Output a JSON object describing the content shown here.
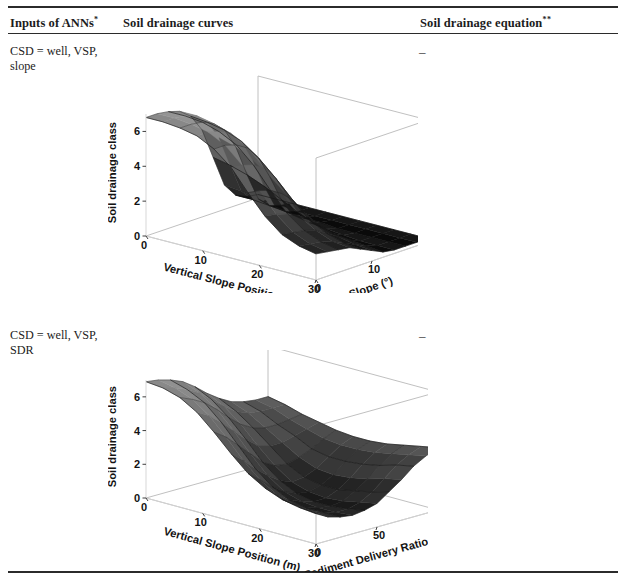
{
  "table": {
    "headers": [
      {
        "text": "Inputs of ANNs",
        "sup": "*"
      },
      {
        "text": "Soil drainage curves",
        "sup": ""
      },
      {
        "text": "Soil drainage equation",
        "sup": "**"
      }
    ],
    "rows": [
      {
        "inputs": "CSD = well, VSP, slope",
        "equation": "–"
      },
      {
        "inputs": "CSD = well, VSP, SDR",
        "equation": "–"
      }
    ]
  },
  "chart_data": [
    {
      "type": "surface",
      "title": "",
      "xlabel": "Vertical Slope Position (m)",
      "ylabel": "Slope (°)",
      "zlabel": "Soil drainage class",
      "xticks": [
        0,
        10,
        20,
        30
      ],
      "yticks": [
        0,
        10,
        20
      ],
      "zticks": [
        0,
        2,
        4,
        6
      ],
      "xlim": [
        0,
        30
      ],
      "ylim": [
        0,
        20
      ],
      "zlim": [
        0,
        7
      ],
      "grid": true,
      "legend": "none",
      "colormap": "gray",
      "description": "Soil drainage class surface; high (~6-7) plateau at low slope / low VSP falling steeply to near 0-1 at high slope, with oscillating ridges near the drop-off edge.",
      "surface_z": [
        [
          6.8,
          6.8,
          6.7,
          6.5,
          6.0,
          5.0,
          3.2,
          1.4,
          0.6,
          0.3,
          0.2
        ],
        [
          6.8,
          6.8,
          6.7,
          6.5,
          5.9,
          4.8,
          3.0,
          1.3,
          0.6,
          0.3,
          0.2
        ],
        [
          6.7,
          6.7,
          6.6,
          6.3,
          5.7,
          4.5,
          2.7,
          1.1,
          0.5,
          0.3,
          0.2
        ],
        [
          6.5,
          6.5,
          6.3,
          6.0,
          5.3,
          4.0,
          2.3,
          0.9,
          0.4,
          0.2,
          0.2
        ],
        [
          6.0,
          6.0,
          5.8,
          5.4,
          4.6,
          3.3,
          1.8,
          0.7,
          0.3,
          0.2,
          0.2
        ],
        [
          5.2,
          5.1,
          4.9,
          4.5,
          3.7,
          2.5,
          1.3,
          0.5,
          0.3,
          0.2,
          0.2
        ],
        [
          4.0,
          3.9,
          3.7,
          3.3,
          2.7,
          1.8,
          0.9,
          0.4,
          0.2,
          0.2,
          0.2
        ],
        [
          2.9,
          2.8,
          2.6,
          2.3,
          1.8,
          1.2,
          0.6,
          0.3,
          0.2,
          0.2,
          0.2
        ],
        [
          2.1,
          2.0,
          1.9,
          1.7,
          1.3,
          0.9,
          0.5,
          0.2,
          0.2,
          0.2,
          0.2
        ],
        [
          1.7,
          1.6,
          1.5,
          1.3,
          1.0,
          0.7,
          0.4,
          0.2,
          0.2,
          0.2,
          0.2
        ],
        [
          1.5,
          1.4,
          1.3,
          1.2,
          0.9,
          0.6,
          0.3,
          0.2,
          0.2,
          0.2,
          0.2
        ]
      ]
    },
    {
      "type": "surface",
      "title": "",
      "xlabel": "Vertical Slope Position (m)",
      "ylabel": "Sediment Delivery Ratio (%)",
      "zlabel": "Soil drainage class",
      "xticks": [
        0,
        10,
        20,
        30
      ],
      "yticks": [
        0,
        50,
        100
      ],
      "zticks": [
        0,
        2,
        4,
        6
      ],
      "xlim": [
        0,
        30
      ],
      "ylim": [
        0,
        100
      ],
      "zlim": [
        0,
        7
      ],
      "grid": true,
      "legend": "none",
      "colormap": "gray",
      "description": "Saddle shaped soil drainage class surface; ~6-7 at low VSP and low SDR, dipping to ~1-2 mid-surface, rising again to ~4 at high SDR.",
      "surface_z": [
        [
          6.9,
          6.8,
          6.6,
          6.3,
          5.8,
          5.2,
          4.7,
          4.3,
          4.1,
          4.0,
          4.0
        ],
        [
          6.8,
          6.6,
          6.3,
          5.9,
          5.3,
          4.7,
          4.2,
          3.9,
          3.8,
          3.8,
          3.8
        ],
        [
          6.5,
          6.2,
          5.8,
          5.2,
          4.5,
          3.9,
          3.5,
          3.3,
          3.3,
          3.4,
          3.5
        ],
        [
          5.9,
          5.5,
          4.9,
          4.2,
          3.5,
          2.9,
          2.7,
          2.7,
          2.9,
          3.1,
          3.3
        ],
        [
          5.0,
          4.5,
          3.8,
          3.1,
          2.4,
          2.0,
          1.9,
          2.1,
          2.4,
          2.8,
          3.1
        ],
        [
          4.0,
          3.4,
          2.7,
          2.1,
          1.6,
          1.3,
          1.4,
          1.7,
          2.2,
          2.7,
          3.0
        ],
        [
          3.1,
          2.5,
          1.9,
          1.4,
          1.1,
          1.0,
          1.2,
          1.6,
          2.2,
          2.7,
          3.0
        ],
        [
          2.5,
          1.9,
          1.4,
          1.1,
          0.9,
          0.9,
          1.2,
          1.7,
          2.3,
          2.8,
          3.1
        ],
        [
          2.1,
          1.6,
          1.2,
          1.0,
          0.9,
          1.0,
          1.4,
          1.9,
          2.5,
          3.0,
          3.3
        ],
        [
          1.9,
          1.5,
          1.2,
          1.0,
          1.0,
          1.2,
          1.6,
          2.2,
          2.8,
          3.2,
          3.5
        ],
        [
          1.8,
          1.4,
          1.2,
          1.1,
          1.2,
          1.4,
          1.9,
          2.4,
          3.0,
          3.4,
          3.7
        ]
      ]
    }
  ]
}
